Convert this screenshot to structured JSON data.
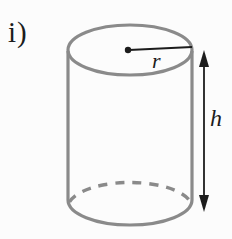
{
  "figure": {
    "item_label": "i)",
    "shape": "cylinder",
    "radius_label": "r",
    "height_label": "h"
  },
  "colors": {
    "background": "#fcfcfc",
    "cylinder_outline": "#8a8a8a",
    "annotation_ink": "#1c1c1c"
  }
}
